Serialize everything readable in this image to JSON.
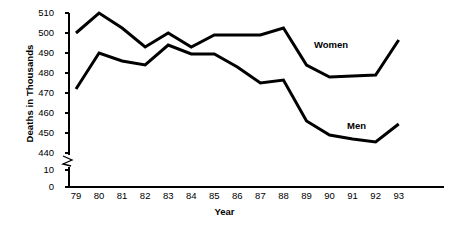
{
  "chart_data": {
    "type": "line",
    "title": "",
    "xlabel": "Year",
    "ylabel": "Deaths in Thousands",
    "categories": [
      "79",
      "80",
      "81",
      "82",
      "83",
      "84",
      "85",
      "86",
      "87",
      "88",
      "89",
      "90",
      "91",
      "92",
      "93"
    ],
    "x": [
      79,
      80,
      81,
      82,
      83,
      84,
      85,
      86,
      87,
      88,
      89,
      90,
      91,
      92,
      93
    ],
    "ylim": [
      440,
      510
    ],
    "y_ticks": [
      510,
      500,
      490,
      480,
      470,
      460,
      450,
      440,
      10,
      0
    ],
    "y_axis_break": true,
    "y_axis_break_between": [
      440,
      10
    ],
    "grid": false,
    "legend_position": "inline-annotations",
    "series": [
      {
        "name": "Women",
        "label_text": "Women",
        "color": "#000000",
        "values": [
          500,
          510,
          502.5,
          493,
          500,
          493,
          499,
          499,
          499,
          502.5,
          484,
          478,
          478.5,
          479,
          496.5
        ]
      },
      {
        "name": "Men",
        "label_text": "Men",
        "color": "#000000",
        "values": [
          472,
          490,
          486,
          484,
          494,
          489.5,
          489.5,
          483,
          475,
          476.5,
          456,
          449,
          447,
          445.5,
          454.5
        ]
      }
    ]
  },
  "axis": {
    "y_title": "Deaths in Thousands",
    "x_title": "Year",
    "y_tick_labels": [
      "510",
      "500",
      "490",
      "480",
      "470",
      "460",
      "450",
      "440",
      "10",
      "0"
    ],
    "x_tick_labels": [
      "79",
      "80",
      "81",
      "82",
      "83",
      "84",
      "85",
      "86",
      "87",
      "88",
      "89",
      "90",
      "91",
      "92",
      "93"
    ]
  },
  "annotations": {
    "women": "Women",
    "men": "Men"
  },
  "colors": {
    "line": "#000000",
    "axis": "#000000",
    "background": "#ffffff"
  }
}
